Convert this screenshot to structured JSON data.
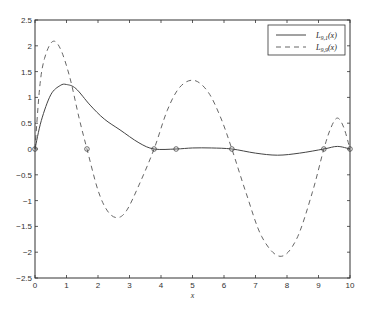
{
  "chart_data": {
    "type": "line",
    "title": "",
    "xlabel": "x",
    "ylabel": "",
    "xlim": [
      0,
      10
    ],
    "ylim": [
      -2.5,
      2.5
    ],
    "grid": false,
    "legend_position": "top-right",
    "x_ticks": [
      0,
      1,
      2,
      3,
      4,
      5,
      6,
      7,
      8,
      9,
      10
    ],
    "x_tick_labels": [
      "0",
      "1",
      "2",
      "3",
      "4",
      "5",
      "6",
      "7",
      "8",
      "9",
      "10"
    ],
    "y_ticks": [
      -2.5,
      -2,
      -1.5,
      -1,
      -0.5,
      0,
      0.5,
      1,
      1.5,
      2,
      2.5
    ],
    "y_tick_labels": [
      "-2.5",
      "-2",
      "-1.5",
      "-1",
      "-0.5",
      "0",
      "0.5",
      "1",
      "1.5",
      "2",
      "2.5"
    ],
    "series": [
      {
        "name": "L_{9,1}(x)",
        "legend_main": "L",
        "legend_sub": "9,1",
        "legend_tail": "(x)",
        "style": "solid",
        "color": "#444444",
        "x": [
          0,
          0.2,
          0.5,
          0.8,
          1.0,
          1.3,
          1.75,
          2.2,
          2.7,
          3.3,
          3.78,
          4.48,
          5.0,
          5.6,
          6.25,
          7.0,
          7.7,
          8.4,
          9.17,
          9.6,
          10
        ],
        "y": [
          0,
          0.55,
          1.05,
          1.23,
          1.25,
          1.17,
          0.85,
          0.58,
          0.37,
          0.12,
          0,
          0,
          0.02,
          0.02,
          0,
          -0.08,
          -0.12,
          -0.08,
          0,
          0.05,
          0
        ]
      },
      {
        "name": "L_{9,9}(x)",
        "legend_main": "L",
        "legend_sub": "9,9",
        "legend_tail": "(x)",
        "style": "dashed",
        "color": "#666666",
        "x": [
          0,
          0.15,
          0.3,
          0.55,
          0.8,
          1.1,
          1.4,
          1.65,
          2.0,
          2.3,
          2.6,
          2.9,
          3.3,
          3.78,
          4.2,
          4.6,
          5.05,
          5.5,
          5.9,
          6.25,
          6.7,
          7.2,
          7.78,
          8.3,
          8.8,
          9.17,
          9.4,
          9.6,
          9.8,
          10
        ],
        "y": [
          0,
          1.2,
          1.75,
          2.08,
          1.95,
          1.4,
          0.6,
          0,
          -0.8,
          -1.2,
          -1.33,
          -1.2,
          -0.7,
          0,
          0.75,
          1.2,
          1.33,
          1.1,
          0.6,
          0,
          -0.85,
          -1.7,
          -2.08,
          -1.75,
          -0.85,
          0,
          0.42,
          0.6,
          0.42,
          0
        ]
      }
    ],
    "markers": {
      "symbol": "circle",
      "x": [
        0,
        1.65,
        3.78,
        4.48,
        6.25,
        9.17,
        10
      ],
      "y": [
        0,
        0,
        0,
        0,
        0,
        0,
        0
      ]
    }
  }
}
